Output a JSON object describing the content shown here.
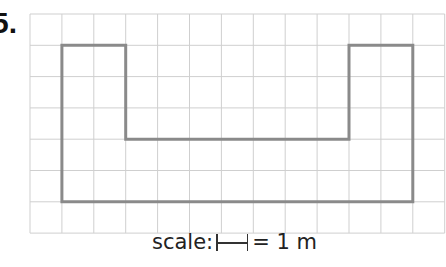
{
  "question": {
    "number": "5."
  },
  "grid": {
    "columns": 13,
    "rows": 7,
    "line_color": "#cfcfcf",
    "origin": [
      30,
      14
    ],
    "cell_w": 31.9,
    "cell_h": 31.3
  },
  "shape": {
    "stroke_color": "#8a8a8a",
    "vertices_grid": [
      [
        1,
        1
      ],
      [
        3,
        1
      ],
      [
        3,
        4
      ],
      [
        10,
        4
      ],
      [
        10,
        1
      ],
      [
        12,
        1
      ],
      [
        12,
        6
      ],
      [
        1,
        6
      ]
    ]
  },
  "caption": {
    "prefix": "scale:",
    "suffix": "= 1 m"
  }
}
